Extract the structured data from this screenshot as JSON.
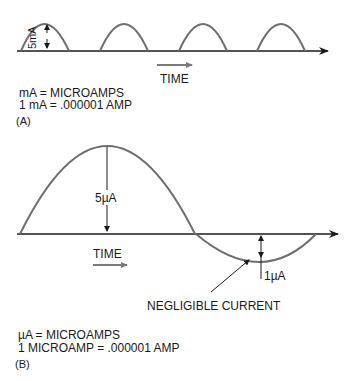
{
  "panel_a": {
    "amplitude_label": "5mA",
    "time_label": "TIME",
    "note_line1": "mA = MICROAMPS",
    "note_line2": "1 mA = .000001 AMP",
    "panel_label": "(A)",
    "pulse_count": 4
  },
  "panel_b": {
    "amplitude_label": "5µA",
    "negative_label": "1µA",
    "time_label": "TIME",
    "callout": "NEGLIGIBLE CURRENT",
    "note_line1": "µA = MICROAMPS",
    "note_line2": "1 MICROAMP = .000001 AMP",
    "panel_label": "(B)"
  },
  "colors": {
    "waveform": "#6e6e6e",
    "axis": "#1a1a1a",
    "time_arrow": "#7a7a7a"
  }
}
